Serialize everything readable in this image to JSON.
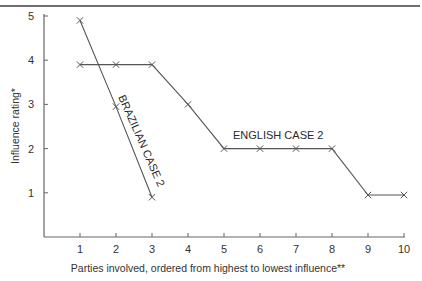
{
  "chart_data": {
    "type": "line",
    "title": "",
    "xlabel": "Parties involved, ordered from highest to lowest influence**",
    "ylabel": "Influence rating*",
    "x_ticks": [
      1,
      2,
      3,
      4,
      5,
      6,
      7,
      8,
      9,
      10
    ],
    "y_ticks": [
      1,
      2,
      3,
      4,
      5
    ],
    "xlim": [
      0,
      10
    ],
    "ylim": [
      0,
      5
    ],
    "grid": false,
    "legend": "inline labels",
    "marker": "x",
    "series": [
      {
        "name": "BRAZILIAN CASE 2",
        "x": [
          1,
          2,
          3
        ],
        "values": [
          4.9,
          2.95,
          0.9
        ]
      },
      {
        "name": "ENGLISH CASE 2",
        "x": [
          1,
          2,
          3,
          4,
          5,
          6,
          7,
          8,
          9,
          10
        ],
        "values": [
          3.9,
          3.9,
          3.9,
          3.0,
          2.0,
          2.0,
          2.0,
          2.0,
          0.95,
          0.95
        ]
      }
    ]
  },
  "labels": {
    "brazilian": "BRAZILIAN CASE 2",
    "english": "ENGLISH CASE 2",
    "xlabel": "Parties involved, ordered from highest to lowest influence**",
    "ylabel": "Influence rating*"
  },
  "colors": {
    "line": "#555555",
    "axis": "#666666",
    "text": "#2a2a2a"
  }
}
